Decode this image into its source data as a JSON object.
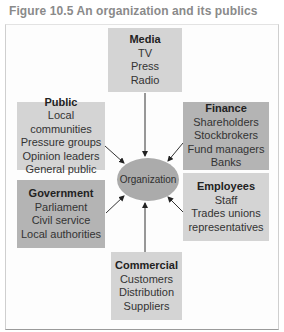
{
  "figure": {
    "title": "Figure 10.5  An organization and its publics"
  },
  "center": {
    "label": "Organization"
  },
  "publics": {
    "media": {
      "heading": "Media",
      "items": [
        "TV",
        "Press",
        "Radio"
      ]
    },
    "public": {
      "heading": "Public",
      "items": [
        "Local communities",
        "Pressure groups",
        "Opinion leaders",
        "General public"
      ]
    },
    "finance": {
      "heading": "Finance",
      "items": [
        "Shareholders",
        "Stockbrokers",
        "Fund managers",
        "Banks"
      ]
    },
    "government": {
      "heading": "Government",
      "items": [
        "Parliament",
        "Civil service",
        "Local authorities"
      ]
    },
    "employees": {
      "heading": "Employees",
      "items": [
        "Staff",
        "Trades unions",
        "representatives"
      ]
    },
    "commercial": {
      "heading": "Commercial",
      "items": [
        "Customers",
        "Distribution",
        "Suppliers"
      ]
    }
  },
  "colors": {
    "light_box": "#d4d4d4",
    "dark_box": "#b4b4b4",
    "ellipse": "#ababab",
    "title": "#8a8a8a"
  }
}
